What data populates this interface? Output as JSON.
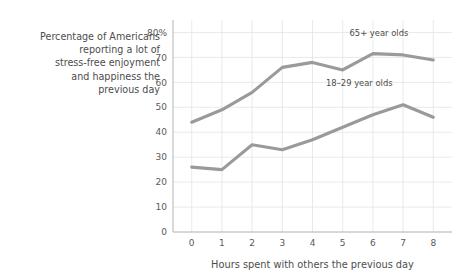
{
  "caption": {
    "lines": [
      "Percentage of Americans",
      "reporting a lot of",
      "stress-free enjoyment",
      "and happiness the",
      "previous day"
    ]
  },
  "chart_data": {
    "type": "line",
    "title": "",
    "xlabel": "Hours spent with others the previous day",
    "ylabel": "",
    "x": [
      0,
      1,
      2,
      3,
      4,
      5,
      6,
      7,
      8
    ],
    "xticklabels": [
      "0",
      "1",
      "2",
      "3",
      "4",
      "5",
      "6",
      "7",
      "8"
    ],
    "yticklabels": [
      "0",
      "10",
      "20",
      "30",
      "40",
      "50",
      "60",
      "70",
      "80%"
    ],
    "yticks": [
      0,
      10,
      20,
      30,
      40,
      50,
      60,
      70,
      80
    ],
    "xlim": [
      -0.62,
      8.62
    ],
    "ylim": [
      0,
      85
    ],
    "grid": true,
    "legend": "inline-annotations",
    "line_color": "#9a9a9a",
    "series": [
      {
        "name": "65+ year olds",
        "label": "65+ year olds",
        "values": [
          44,
          49,
          56,
          66,
          68,
          65,
          71.5,
          71,
          69
        ],
        "label_x": 6.2,
        "label_y": 78.5
      },
      {
        "name": "18–29 year olds",
        "label": "18–29 year olds",
        "values": [
          26,
          25,
          35,
          33,
          37,
          42,
          47,
          51,
          46
        ],
        "label_x": 5.55,
        "label_y": 58.5
      }
    ]
  }
}
